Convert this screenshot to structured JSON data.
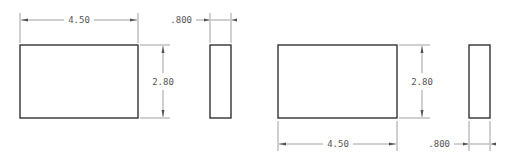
{
  "drawing": {
    "views": [
      {
        "name": "layout-a",
        "front": {
          "width_label": "4.50",
          "height_label": "2.80",
          "dim_width_position": "top"
        },
        "side": {
          "thickness_label": ".800",
          "dim_position": "top"
        }
      },
      {
        "name": "layout-b",
        "front": {
          "width_label": "4.50",
          "height_label": "2.80",
          "dim_width_position": "bottom"
        },
        "side": {
          "thickness_label": ".800",
          "dim_position": "bottom"
        }
      }
    ],
    "colors": {
      "object_line": "#333333",
      "dimension_line": "#888888",
      "text": "#555555",
      "background": "#ffffff"
    }
  }
}
